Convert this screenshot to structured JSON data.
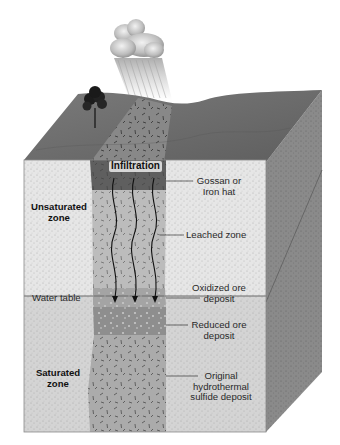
{
  "figure": {
    "type": "block-diagram"
  },
  "colors": {
    "ground_surface": "#6e6e6e",
    "unsaturated_zone": "#e4e4e4",
    "saturated_zone": "#d2d2d2",
    "side_face": "#8a8a8a",
    "gossan": "#5c5c5c",
    "leached_zone": "#b9b9b9",
    "oxidized_ore": "#a3a3a3",
    "reduced_ore": "#8f8f8f",
    "original_sulfide": "#a9a9a9",
    "water_table_line": "#6a6a6a"
  },
  "scene": {
    "cloud": "rain-cloud",
    "rain": "rain-streaks",
    "tree": "tree",
    "surface_outcrop": "gossan-outcrop"
  },
  "labels": {
    "infiltration": "Infiltration",
    "unsaturated_zone": [
      "Unsaturated",
      "zone"
    ],
    "saturated_zone": [
      "Saturated",
      "zone"
    ],
    "water_table": "Water table",
    "gossan": [
      "Gossan or",
      "Iron hat"
    ],
    "leached_zone": "Leached zone",
    "oxidized_ore": [
      "Oxidized ore",
      "deposit"
    ],
    "reduced_ore": [
      "Reduced ore",
      "deposit"
    ],
    "original_sulfide": [
      "Original",
      "hydrothermal",
      "sulfide deposit"
    ]
  },
  "arrows": {
    "count": 3,
    "meaning": "downward infiltration of groundwater"
  }
}
